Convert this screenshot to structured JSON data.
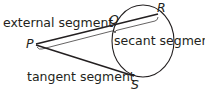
{
  "diagram": {
    "labels": {
      "external": "external segment",
      "secant": "secant segment",
      "tangent": "tangent segment"
    },
    "points": {
      "P": "P",
      "Q": "Q",
      "R": "R",
      "S": "S"
    },
    "colors": {
      "stroke": "#231f20",
      "background": "#ffffff"
    }
  }
}
